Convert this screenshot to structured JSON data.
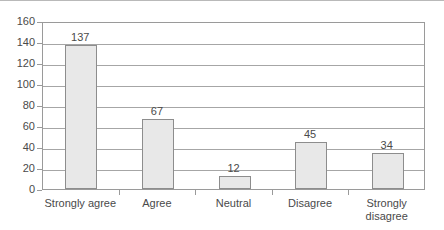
{
  "chart_data": {
    "type": "bar",
    "title": "",
    "subtitle": "",
    "xlabel": "",
    "ylabel": "",
    "categories": [
      "Strongly agree",
      "Agree",
      "Neutral",
      "Disagree",
      "Strongly disagree"
    ],
    "values": [
      137,
      67,
      12,
      45,
      34
    ],
    "value_labels": [
      "137",
      "67",
      "12",
      "45",
      "34"
    ],
    "ylim": [
      0,
      160
    ],
    "ytick_step": 20,
    "yticks": [
      0,
      20,
      40,
      60,
      80,
      100,
      120,
      140,
      160
    ],
    "ytick_labels": [
      "0",
      "20",
      "40",
      "60",
      "80",
      "100",
      "120",
      "140",
      "160"
    ],
    "grid": "horizontal",
    "legend": "none",
    "series": [
      {
        "name": "",
        "values": [
          137,
          67,
          12,
          45,
          34
        ]
      }
    ],
    "colors": {
      "bar_fill": "#e8e8e8",
      "bar_border": "#8d8d8d",
      "gridline": "#a6a6a6",
      "axis": "#9a9a9a",
      "text": "#4a4a4a",
      "background": "#ffffff"
    }
  }
}
